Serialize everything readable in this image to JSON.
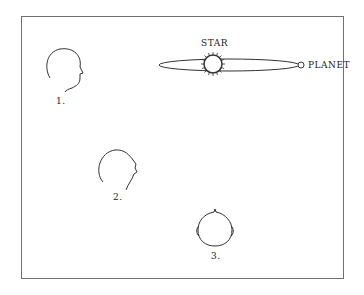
{
  "diagram": {
    "star_label": "STAR",
    "planet_label": "PLANET",
    "heads": [
      {
        "label": "1.",
        "view": "profile-level"
      },
      {
        "label": "2.",
        "view": "profile-tilted-up"
      },
      {
        "label": "3.",
        "view": "top-of-head"
      }
    ]
  },
  "colors": {
    "line": "#333333",
    "frame": "#707070"
  }
}
